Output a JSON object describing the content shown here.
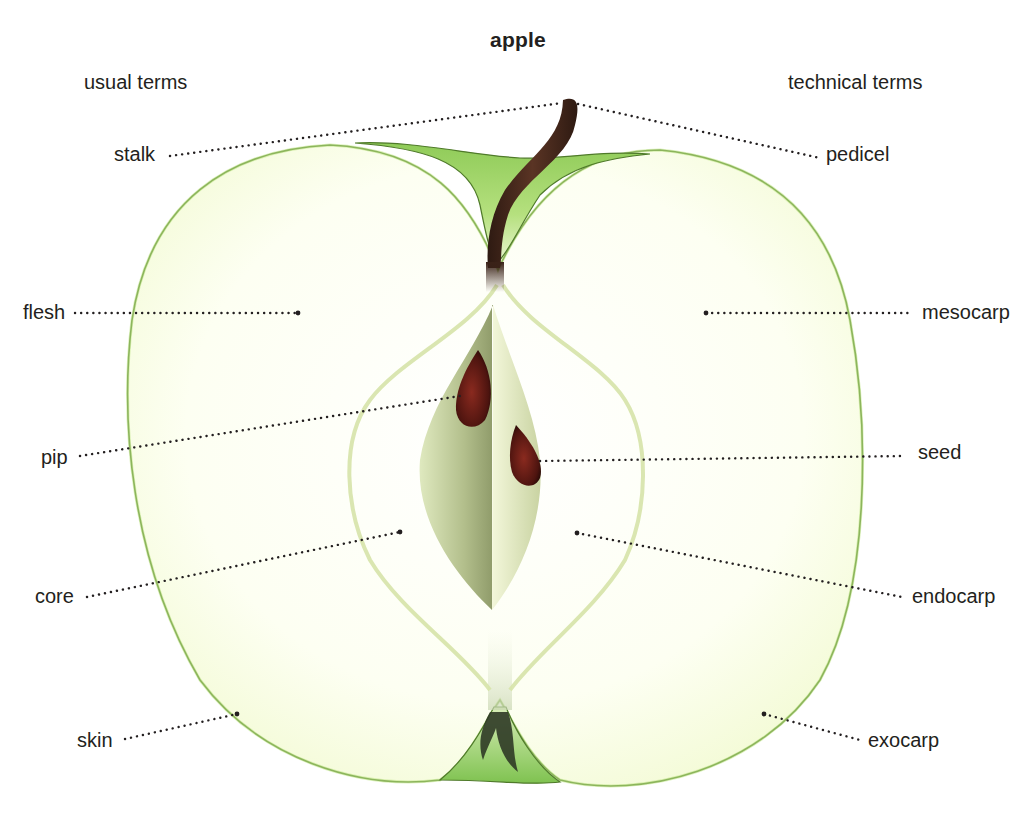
{
  "title": "apple",
  "columns": {
    "left_heading": "usual terms",
    "right_heading": "technical terms"
  },
  "labels": {
    "left": [
      {
        "id": "stalk",
        "text": "stalk"
      },
      {
        "id": "flesh",
        "text": "flesh"
      },
      {
        "id": "pip",
        "text": "pip"
      },
      {
        "id": "core",
        "text": "core"
      },
      {
        "id": "skin",
        "text": "skin"
      }
    ],
    "right": [
      {
        "id": "pedicel",
        "text": "pedicel"
      },
      {
        "id": "mesocarp",
        "text": "mesocarp"
      },
      {
        "id": "seed",
        "text": "seed"
      },
      {
        "id": "endocarp",
        "text": "endocarp"
      },
      {
        "id": "exocarp",
        "text": "exocarp"
      }
    ]
  },
  "colors": {
    "skin_outline": "#4f7a2a",
    "skin_green": "#a6d66a",
    "flesh": "#fdfff0",
    "core_line": "#d9e6b0",
    "stalk": "#4a2a1c",
    "seed": "#6b1d15",
    "leader": "#231f20"
  }
}
